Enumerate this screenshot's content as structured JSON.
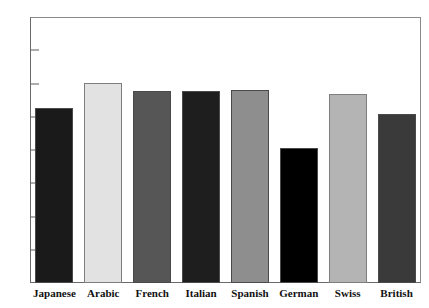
{
  "chart_data": {
    "type": "bar",
    "title": "",
    "subtitle": "",
    "xlabel": "",
    "ylabel": "",
    "ylim": [
      0,
      8
    ],
    "grid": false,
    "legend": "none",
    "categories": [
      "Japanese",
      "Arabic",
      "French",
      "Italian",
      "Spanish",
      "German",
      "Swiss",
      "British"
    ],
    "values": [
      5.25,
      6.03,
      5.78,
      5.78,
      5.8,
      4.06,
      5.67,
      5.08
    ],
    "bar_colors": [
      "#1a1a1a",
      "#e2e2e2",
      "#565656",
      "#1e1e1e",
      "#8e8e8e",
      "#000000",
      "#b4b4b4",
      "#3a3a3a"
    ],
    "y_ticks": [
      {
        "value": 0,
        "label": "0"
      },
      {
        "value": 1,
        "label": "1"
      },
      {
        "value": 2,
        "label": "2"
      },
      {
        "value": 3,
        "label": "3"
      },
      {
        "value": 4,
        "label": "4"
      },
      {
        "value": 5,
        "label": "5"
      },
      {
        "value": 6,
        "label": "6"
      },
      {
        "value": 7,
        "label": "7"
      },
      {
        "value": 8,
        "label": "8"
      }
    ]
  }
}
